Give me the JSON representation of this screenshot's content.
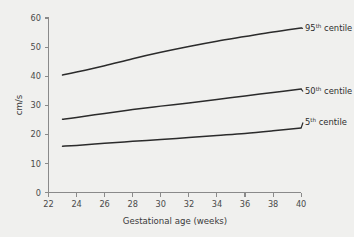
{
  "chart_data": {
    "type": "line",
    "title": "",
    "subtitle": "",
    "xlabel": "Gestational age (weeks)",
    "ylabel": "cm/s",
    "xlim": [
      22,
      40
    ],
    "ylim": [
      0,
      60
    ],
    "xticks": [
      22,
      24,
      26,
      28,
      30,
      32,
      34,
      36,
      38,
      40
    ],
    "yticks": [
      0,
      10,
      20,
      30,
      40,
      50,
      60
    ],
    "grid": false,
    "legend_position": "inline-right-end-labels",
    "x": [
      23,
      24,
      26,
      28,
      30,
      32,
      34,
      36,
      38,
      40
    ],
    "series": [
      {
        "name": "95th centile",
        "label_text": "95",
        "label_sup": "th",
        "label_suffix": " centile",
        "color": "#2b2b2b",
        "values": [
          40.4,
          41.4,
          43.6,
          46.0,
          48.2,
          50.2,
          52.0,
          53.6,
          55.2,
          56.6
        ]
      },
      {
        "name": "50th centile",
        "label_text": "50",
        "label_sup": "th",
        "label_suffix": " centile",
        "color": "#2b2b2b",
        "values": [
          25.2,
          25.8,
          27.2,
          28.5,
          29.7,
          30.8,
          32.0,
          33.2,
          34.4,
          35.6
        ]
      },
      {
        "name": "5th centile",
        "label_text": "5",
        "label_sup": "th",
        "label_suffix": " centile",
        "color": "#2b2b2b",
        "values": [
          15.9,
          16.2,
          16.9,
          17.6,
          18.2,
          18.9,
          19.6,
          20.3,
          21.2,
          22.2
        ]
      }
    ]
  },
  "axes": {
    "y_label": "cm/s",
    "x_label": "Gestational age (weeks)",
    "y_tick_labels": [
      "0",
      "10",
      "20",
      "30",
      "40",
      "50",
      "60"
    ],
    "x_tick_labels": [
      "22",
      "24",
      "26",
      "28",
      "30",
      "32",
      "34",
      "36",
      "38",
      "40"
    ]
  },
  "annotations": {
    "series_0_label": "95th centile",
    "series_1_label": "50th centile",
    "series_2_label": "5th centile"
  },
  "colors": {
    "background": "#f0f0ee",
    "axis": "#8a8a8a",
    "curve": "#2b2b2b",
    "tick_text": "#4a4a4a",
    "title_text": "#3a3a3a"
  }
}
